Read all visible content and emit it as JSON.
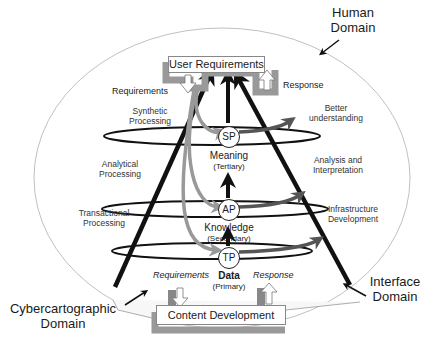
{
  "domains": {
    "human": "Human Domain",
    "human_l1": "Human",
    "human_l2": "Domain",
    "interface_l1": "Interface",
    "interface_l2": "Domain",
    "cyber_l1": "Cybercartographic",
    "cyber_l2": "Domain"
  },
  "boxes": {
    "top": "User Requirements",
    "bottom": "Content Development"
  },
  "top_flows": {
    "requirements": "Requirements",
    "response": "Response"
  },
  "bottom_flows": {
    "requirements": "Requirements",
    "response": "Response"
  },
  "processing": {
    "synthetic_l1": "Synthetic",
    "synthetic_l2": "Processing",
    "analytical_l1": "Analytical",
    "analytical_l2": "Processing",
    "transactional_l1": "Transactional",
    "transactional_l2": "Processing"
  },
  "outcomes": {
    "better_l1": "Better",
    "better_l2": "understanding",
    "analysis_l1": "Analysis and",
    "analysis_l2": "Interpretation",
    "infra_l1": "Infrastructure",
    "infra_l2": "Development"
  },
  "levels": [
    {
      "node": "SP",
      "name": "Meaning",
      "tier": "(Tertiary)"
    },
    {
      "node": "AP",
      "name": "Knowledge",
      "tier": "(Secondary)"
    },
    {
      "node": "TP",
      "name": "Data",
      "tier": "(Primary)"
    }
  ],
  "colors": {
    "black_arrow": "#111111",
    "gray_arrow": "#9a9a9a",
    "dark_gray_arrow": "#555555",
    "ellipse": "#aaaaaa"
  }
}
